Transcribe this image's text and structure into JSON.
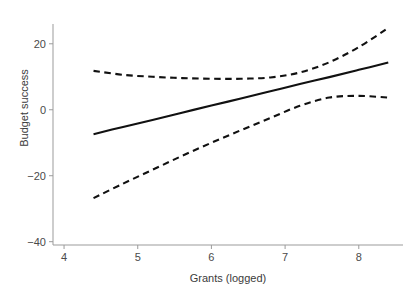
{
  "chart_data": {
    "type": "line",
    "title": "",
    "xlabel": "Grants (logged)",
    "ylabel": "Budget success",
    "xlim": [
      3.85,
      8.6
    ],
    "ylim": [
      -41,
      26
    ],
    "xticks": [
      4,
      5,
      6,
      7,
      8
    ],
    "xtick_labels": [
      "4",
      "5",
      "6",
      "7",
      "8"
    ],
    "yticks": [
      20,
      0,
      -20,
      -40
    ],
    "ytick_labels": [
      "20",
      "0",
      "−20",
      "−40"
    ],
    "grid": false,
    "legend": "none",
    "line_color": "#111111",
    "axis_color": "#9b9b9b",
    "text_color": "#3b3b3b",
    "series": [
      {
        "name": "fit",
        "style": "solid",
        "x": [
          4.4,
          4.8,
          5.2,
          5.6,
          6.0,
          6.4,
          6.8,
          7.2,
          7.6,
          8.0,
          8.4
        ],
        "values": [
          -7.4,
          -5.2,
          -3.1,
          -0.9,
          1.3,
          3.4,
          5.6,
          7.8,
          9.9,
          12.1,
          14.3
        ]
      },
      {
        "name": "upper-confidence-band",
        "style": "dashed",
        "x": [
          4.4,
          4.8,
          5.2,
          5.6,
          6.0,
          6.4,
          6.8,
          7.2,
          7.6,
          8.0,
          8.4
        ],
        "values": [
          11.8,
          10.6,
          10.0,
          9.6,
          9.4,
          9.4,
          9.8,
          11.3,
          14.4,
          19.0,
          24.8
        ]
      },
      {
        "name": "lower-confidence-band",
        "style": "dashed",
        "x": [
          4.4,
          4.8,
          5.2,
          5.6,
          6.0,
          6.4,
          6.8,
          7.2,
          7.6,
          8.0,
          8.4
        ],
        "values": [
          -26.8,
          -22.4,
          -18.2,
          -14.0,
          -10.0,
          -6.2,
          -2.5,
          1.2,
          3.7,
          4.2,
          3.7
        ]
      }
    ]
  }
}
